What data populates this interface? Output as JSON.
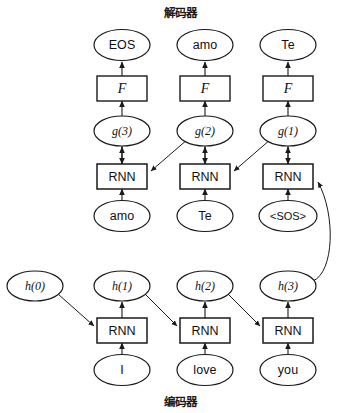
{
  "figure": {
    "type": "diagram",
    "subtype": "seq2seq-encoder-decoder-rnn",
    "width": 348,
    "height": 413,
    "background_color": "#ffffff",
    "stroke_color": "#1a1a1a"
  },
  "titles": {
    "decoder": "解码器",
    "encoder": "编码器"
  },
  "decoder": {
    "outputs": [
      {
        "label": "EOS"
      },
      {
        "label": "amo"
      },
      {
        "label": "Te"
      }
    ],
    "transforms": [
      {
        "label": "F"
      },
      {
        "label": "F"
      },
      {
        "label": "F"
      }
    ],
    "states": [
      {
        "label": "g(3)"
      },
      {
        "label": "g(2)"
      },
      {
        "label": "g(1)"
      }
    ],
    "cells": [
      {
        "label": "RNN"
      },
      {
        "label": "RNN"
      },
      {
        "label": "RNN"
      }
    ],
    "inputs": [
      {
        "label": "amo"
      },
      {
        "label": "Te"
      },
      {
        "label": "<SOS>"
      }
    ]
  },
  "encoder": {
    "states": [
      {
        "label": "h(0)"
      },
      {
        "label": "h(1)"
      },
      {
        "label": "h(2)"
      },
      {
        "label": "h(3)"
      }
    ],
    "cells": [
      {
        "label": "RNN"
      },
      {
        "label": "RNN"
      },
      {
        "label": "RNN"
      }
    ],
    "inputs": [
      {
        "label": "I"
      },
      {
        "label": "love"
      },
      {
        "label": "you"
      }
    ]
  },
  "geometry": {
    "columns_x": [
      35,
      122,
      205,
      288
    ],
    "rows_y": {
      "decoder_title": 12,
      "decoder_output": 45,
      "decoder_transform": 88,
      "decoder_state": 131,
      "decoder_cell": 176,
      "decoder_input": 216,
      "encoder_state": 286,
      "encoder_cell": 330,
      "encoder_input": 370,
      "encoder_title": 401
    },
    "ellipse_rx": 28,
    "ellipse_ry": 15,
    "box_w": 50,
    "box_h": 24
  }
}
